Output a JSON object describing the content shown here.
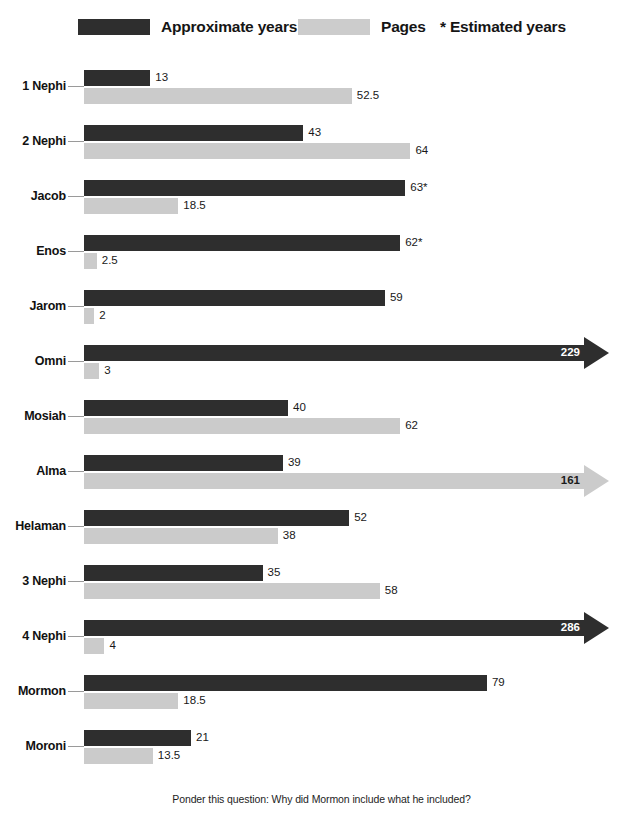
{
  "legend": {
    "years_label": "Approximate years",
    "pages_label": "Pages",
    "estimated_note": "* Estimated years"
  },
  "footer": {
    "note": "Ponder this question: Why did Mormon include what he included?"
  },
  "colors": {
    "years_bar": "#2e2e2e",
    "pages_bar": "#cbcbcb",
    "background": "#ffffff",
    "text": "#1a1a1a"
  },
  "chart_data": {
    "type": "bar",
    "orientation": "horizontal",
    "title": "",
    "subtitle": "",
    "xlabel": "",
    "ylabel": "",
    "grid": false,
    "legend_position": "top",
    "axis_note": "Bars ending in an arrowhead are truncated; their value label sits inside the arrow.",
    "categories": [
      "1 Nephi",
      "2 Nephi",
      "Jacob",
      "Enos",
      "Jarom",
      "Omni",
      "Mosiah",
      "Alma",
      "Helaman",
      "3 Nephi",
      "4 Nephi",
      "Mormon",
      "Moroni"
    ],
    "series": [
      {
        "name": "Approximate years",
        "color": "#2e2e2e",
        "values": [
          13,
          43,
          63,
          62,
          59,
          229,
          40,
          39,
          52,
          35,
          286,
          79,
          21
        ],
        "labels": [
          "13",
          "43",
          "63*",
          "62*",
          "59",
          "229",
          "40",
          "39",
          "52",
          "35",
          "286",
          "79",
          "21"
        ],
        "estimated": [
          false,
          false,
          true,
          true,
          false,
          false,
          false,
          false,
          false,
          false,
          false,
          false,
          false
        ],
        "truncated": [
          false,
          false,
          false,
          false,
          false,
          true,
          false,
          false,
          false,
          false,
          true,
          false,
          false
        ]
      },
      {
        "name": "Pages",
        "color": "#cbcbcb",
        "values": [
          52.5,
          64,
          18.5,
          2.5,
          2,
          3,
          62,
          161,
          38,
          58,
          4,
          18.5,
          13.5
        ],
        "labels": [
          "52.5",
          "64",
          "18.5",
          "2.5",
          "2",
          "3",
          "62",
          "161",
          "38",
          "58",
          "4",
          "18.5",
          "13.5"
        ],
        "estimated": [
          false,
          false,
          false,
          false,
          false,
          false,
          false,
          false,
          false,
          false,
          false,
          false,
          false
        ],
        "truncated": [
          false,
          false,
          false,
          false,
          false,
          false,
          false,
          true,
          false,
          false,
          false,
          false,
          false
        ]
      }
    ]
  },
  "render": {
    "px_per_unit_years": 5.1,
    "px_per_unit_pages": 5.1,
    "truncated_bar_px": 500,
    "max_bar_px": 510
  }
}
